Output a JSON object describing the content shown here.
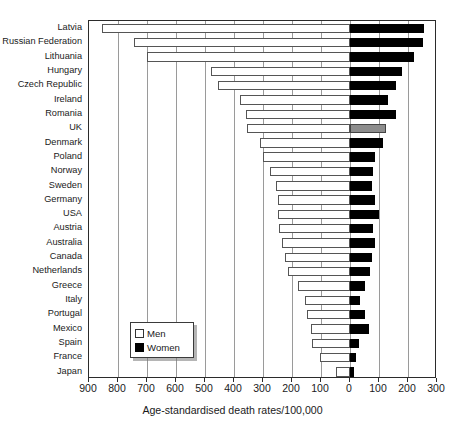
{
  "chart_data": {
    "type": "bar",
    "title": "",
    "xlabel": "Age-standardised death rates/100,000",
    "ylabel": "",
    "orientation": "horizontal-diverging",
    "grid": true,
    "legend_position": "inside-bottom-left",
    "axis": {
      "left_max": 900,
      "right_max": 300,
      "zero_value": 0,
      "tick_step": 100,
      "tick_labels": [
        "900",
        "800",
        "700",
        "600",
        "500",
        "400",
        "300",
        "200",
        "100",
        "0",
        "100",
        "200",
        "300"
      ],
      "tick_values": [
        -900,
        -800,
        -700,
        -600,
        -500,
        -400,
        -300,
        -200,
        -100,
        0,
        100,
        200,
        300
      ]
    },
    "categories": [
      "Latvia",
      "Russian Federation",
      "Lithuania",
      "Hungary",
      "Czech Republic",
      "Ireland",
      "Romania",
      "UK",
      "Denmark",
      "Poland",
      "Norway",
      "Sweden",
      "Germany",
      "USA",
      "Austria",
      "Australia",
      "Canada",
      "Netherlands",
      "Greece",
      "Italy",
      "Portugal",
      "Mexico",
      "Spain",
      "France",
      "Japan"
    ],
    "series": [
      {
        "name": "Men",
        "direction": "left",
        "color": "#ffffff",
        "values": [
          855,
          745,
          700,
          480,
          455,
          380,
          360,
          355,
          310,
          300,
          275,
          255,
          250,
          250,
          245,
          235,
          225,
          215,
          180,
          155,
          150,
          135,
          130,
          105,
          50
        ]
      },
      {
        "name": "Women",
        "direction": "right",
        "color": "#000000",
        "values": [
          255,
          250,
          220,
          180,
          160,
          130,
          160,
          125,
          115,
          85,
          80,
          75,
          85,
          100,
          80,
          85,
          75,
          70,
          50,
          35,
          50,
          65,
          30,
          20,
          15
        ]
      }
    ],
    "highlight": {
      "category": "UK",
      "series": "Women",
      "color": "#8d8d8d"
    }
  },
  "legend": {
    "items": [
      {
        "label": "Men",
        "swatch": "men-swatch"
      },
      {
        "label": "Women",
        "swatch": "women-swatch"
      }
    ]
  }
}
